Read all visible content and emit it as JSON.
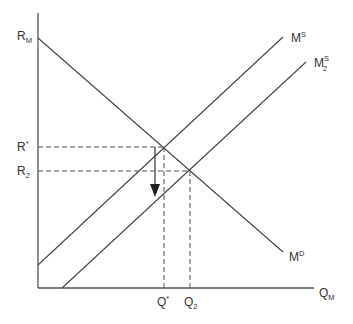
{
  "diagram": {
    "type": "supply-demand",
    "axes": {
      "y_label": {
        "main": "R",
        "sub": "M"
      },
      "x_label": {
        "main": "Q",
        "sub": "M"
      }
    },
    "curves": [
      {
        "id": "demand",
        "label": {
          "main": "M",
          "sup": "D"
        }
      },
      {
        "id": "supply",
        "label": {
          "main": "M",
          "sup": "S"
        }
      },
      {
        "id": "supply2",
        "label": {
          "main": "M",
          "sup": "S",
          "sub": "2"
        }
      }
    ],
    "price_levels": [
      {
        "id": "r-star",
        "label": {
          "main": "R",
          "sup": "*"
        }
      },
      {
        "id": "r2",
        "label": {
          "main": "R",
          "sub": "2"
        }
      }
    ],
    "quantity_levels": [
      {
        "id": "q-star",
        "label": {
          "main": "Q",
          "sup": "*"
        }
      },
      {
        "id": "q2",
        "label": {
          "main": "Q",
          "sub": "2"
        }
      }
    ],
    "annotation": "downward arrow from R* indicating fall in interest rate",
    "colors": {
      "line": "#444444",
      "text": "#333333",
      "background": "#ffffff"
    }
  }
}
